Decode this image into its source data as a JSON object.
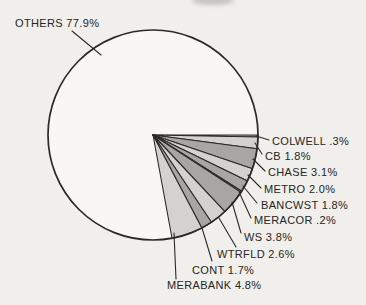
{
  "page": {
    "background": "#f0efeb",
    "ink": "#2b2a28"
  },
  "chart_data": {
    "type": "pie",
    "title": "",
    "subtitle": "",
    "legend": "none",
    "units": "percent",
    "total": 100.0,
    "label_format": "NAME VALUE%",
    "palette": {
      "light": "#d3d2cf",
      "mid": "#a7a6a3",
      "interior": "#f8f7f4",
      "outline": "#2b2a28",
      "leader": "#2b2a28"
    },
    "geometry": {
      "cx": 153,
      "cy": 135,
      "r": 105,
      "start_angle_deg": 0,
      "direction": "clockwise",
      "outline_width": 1.7,
      "edge_width": 1.1
    },
    "slices": [
      {
        "name": "COLWELL",
        "label": "COLWELL .3%",
        "value": 0.3,
        "tone": "mid",
        "label_xy": [
          272,
          141
        ],
        "leader": [
          256,
          136,
          269,
          140
        ]
      },
      {
        "name": "CB",
        "label": "CB 1.8%",
        "value": 1.8,
        "tone": "light",
        "label_xy": [
          265,
          156
        ],
        "leader": [
          255,
          143,
          262,
          154
        ]
      },
      {
        "name": "CHASE",
        "label": "CHASE 3.1%",
        "value": 3.1,
        "tone": "mid",
        "label_xy": [
          268,
          172
        ],
        "leader": [
          253,
          159,
          265,
          171
        ]
      },
      {
        "name": "METRO",
        "label": "METRO 2.0%",
        "value": 2.0,
        "tone": "light",
        "label_xy": [
          264,
          189
        ],
        "leader": [
          248,
          175,
          261,
          188
        ]
      },
      {
        "name": "BANCWST",
        "label": "BANCWST 1.8%",
        "value": 1.8,
        "tone": "mid",
        "label_xy": [
          261,
          205
        ],
        "leader": [
          243,
          186,
          257,
          203
        ]
      },
      {
        "name": "MERACOR",
        "label": "MERACOR .2%",
        "value": 0.2,
        "tone": "light",
        "label_xy": [
          254,
          220
        ],
        "leader": [
          239,
          192,
          251,
          218
        ]
      },
      {
        "name": "WS",
        "label": "WS 3.8%",
        "value": 3.8,
        "tone": "mid",
        "label_xy": [
          244,
          237
        ],
        "leader": [
          232,
          202,
          241,
          233
        ]
      },
      {
        "name": "WTRFLD",
        "label": "WTRFLD 2.6%",
        "value": 2.6,
        "tone": "light",
        "label_xy": [
          217,
          254
        ],
        "leader": [
          219,
          218,
          236,
          247
        ]
      },
      {
        "name": "CONT",
        "label": "CONT 1.7%",
        "value": 1.7,
        "tone": "mid",
        "label_xy": [
          192,
          270
        ],
        "leader": [
          202,
          228,
          212,
          261
        ]
      },
      {
        "name": "MERABANK",
        "label": "MERABANK 4.8%",
        "value": 4.8,
        "tone": "light",
        "label_xy": [
          167,
          285
        ],
        "leader": [
          174,
          233,
          176,
          279
        ]
      }
    ],
    "others": {
      "name": "OTHERS",
      "label": "OTHERS 77.9%",
      "value": 77.9,
      "tone": "interior",
      "label_xy": [
        15,
        23
      ],
      "leader": [
        72,
        31,
        101,
        55
      ]
    }
  }
}
